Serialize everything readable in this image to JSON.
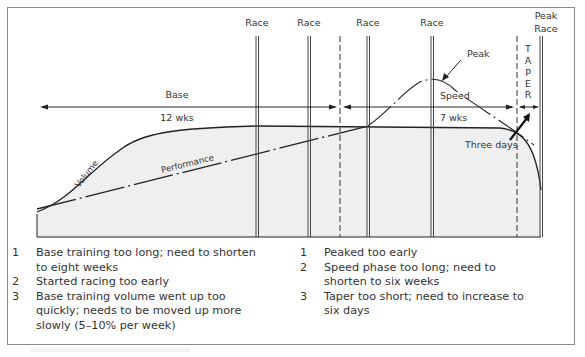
{
  "diagram": {
    "title": "",
    "race_labels": [
      "Race",
      "Race",
      "Race",
      "Race"
    ],
    "peak_race_label": [
      "Peak",
      "Race"
    ],
    "taper_letters": [
      "T",
      "A",
      "P",
      "E",
      "R"
    ],
    "base_label": "Base",
    "base_duration": "12 wks",
    "speed_label": "Speed",
    "speed_duration": "7 wks",
    "peak_label": "Peak",
    "three_days_label": "Three days",
    "volume_label": "Volume",
    "performance_label": "Performance",
    "colors": {
      "fill": "#efefef",
      "line": "#222222",
      "frame": "#8a8a8a"
    }
  },
  "notes": {
    "left": [
      {
        "num": "1",
        "text": "Base training too long; need to shorten to eight weeks"
      },
      {
        "num": "2",
        "text": "Started racing too early"
      },
      {
        "num": "3",
        "text": "Base training volume went up too quickly; needs to be moved up more slowly (5–10% per week)"
      }
    ],
    "right": [
      {
        "num": "1",
        "text": "Peaked too early"
      },
      {
        "num": "2",
        "text": "Speed phase too long; need to shorten to six weeks"
      },
      {
        "num": "3",
        "text": "Taper too short; need to increase to six days"
      }
    ]
  }
}
